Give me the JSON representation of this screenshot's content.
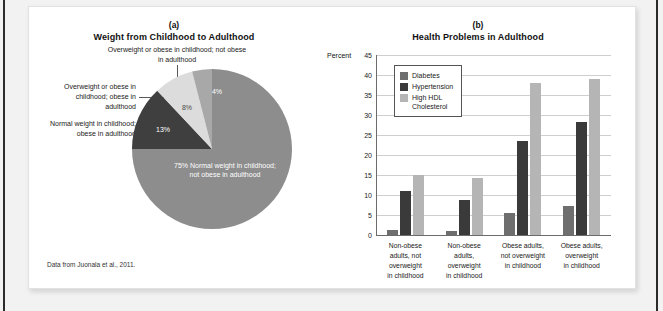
{
  "figure": {
    "source_note": "Data from Juonala et al., 2011."
  },
  "panel_a": {
    "letter": "(a)",
    "title": "Weight from Childhood to Adulthood",
    "callouts": {
      "top": "Overweight or obese in childhood;\nnot obese in adulthood",
      "middle": "Overweight or\nobese in childhood;\nobese in adulthood",
      "lower": "Normal weight in\nchildhood; obese\nin adulthood"
    },
    "inner_labels": {
      "major": "75%\nNormal weight in\nchildhood; not obese in\nadulthood",
      "dark": "13%",
      "light": "8%",
      "medium": "4%"
    }
  },
  "panel_b": {
    "letter": "(b)",
    "title": "Health Problems in Adulthood",
    "axis_unit": "Percent"
  },
  "colors": {
    "pie_major": "#8d8d8d",
    "pie_dark": "#3f3f3f",
    "pie_light": "#dcdcdc",
    "pie_medium": "#a8a8a8",
    "diabetes": "#6e6e6e",
    "hypertension": "#3a3a3a",
    "cholesterol": "#b5b5b5",
    "card_bg": "#ffffff",
    "page_bg": "#f2f2f2"
  },
  "chart_data": [
    {
      "type": "pie",
      "title": "Weight from Childhood to Adulthood",
      "subtitle": "(a)",
      "labels": [
        "Normal weight in childhood; not obese in adulthood",
        "Normal weight in childhood; obese in adulthood",
        "Overweight or obese in childhood; obese in adulthood",
        "Overweight or obese in childhood; not obese in adulthood"
      ],
      "values": [
        75,
        13,
        8,
        4
      ],
      "value_labels": [
        "75%",
        "13%",
        "8%",
        "4%"
      ],
      "colors": [
        "#8d8d8d",
        "#3f3f3f",
        "#dcdcdc",
        "#a8a8a8"
      ],
      "legend": "callouts",
      "note": "Data from Juonala et al., 2011."
    },
    {
      "type": "bar",
      "title": "Health Problems in Adulthood",
      "subtitle": "(b)",
      "xlabel": "",
      "ylabel": "Percent",
      "ylim": [
        0,
        45
      ],
      "yticks": [
        0,
        5,
        10,
        15,
        20,
        25,
        30,
        35,
        40,
        45
      ],
      "grid": true,
      "legend_position": "upper-left-inside",
      "categories": [
        "Non-obese adults, not overweight in childhood",
        "Non-obese adults, overweight in childhood",
        "Obese adults, not overweight in childhood",
        "Obese adults, overweight in childhood"
      ],
      "category_lines": [
        [
          "Non-obese",
          "adults, not",
          "overweight",
          "in childhood"
        ],
        [
          "Non-obese",
          "adults,",
          "overweight",
          "in childhood"
        ],
        [
          "Obese adults,",
          "not overweight",
          "in childhood"
        ],
        [
          "Obese adults,",
          "overweight",
          "in childhood"
        ]
      ],
      "series": [
        {
          "name": "Diabetes",
          "color": "#6e6e6e",
          "values": [
            1.2,
            1.0,
            5.6,
            7.2
          ]
        },
        {
          "name": "Hypertension",
          "color": "#3a3a3a",
          "values": [
            11.0,
            8.8,
            23.5,
            28.2
          ]
        },
        {
          "name": "High HDL Cholesterol",
          "color": "#b5b5b5",
          "values": [
            15.0,
            14.2,
            38.0,
            39.0
          ]
        }
      ],
      "legend_labels": [
        "Diabetes",
        "Hypertension",
        "High HDL\nCholesterol"
      ]
    }
  ]
}
